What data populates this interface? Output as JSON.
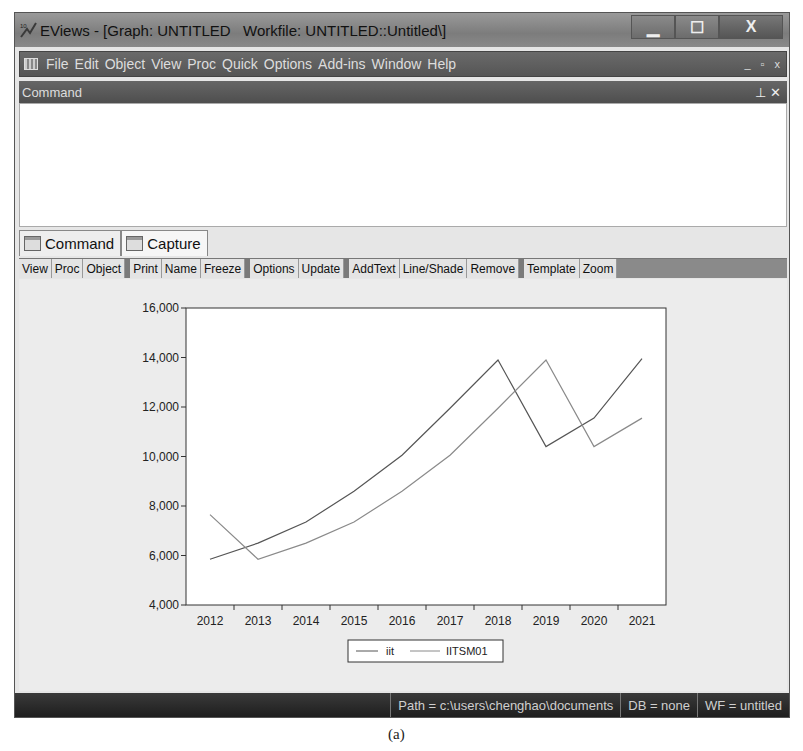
{
  "window": {
    "title": "EViews - [Graph: UNTITLED   Workfile: UNTITLED::Untitled\\]",
    "app_icon": "eviews-logo-icon",
    "controls": [
      "minimize",
      "maximize",
      "close"
    ]
  },
  "menubar": {
    "items": [
      {
        "label": "File"
      },
      {
        "label": "Edit"
      },
      {
        "label": "Object"
      },
      {
        "label": "View"
      },
      {
        "label": "Proc"
      },
      {
        "label": "Quick"
      },
      {
        "label": "Options"
      },
      {
        "label": "Add-ins"
      },
      {
        "label": "Window"
      },
      {
        "label": "Help"
      }
    ],
    "mdi_controls": [
      "_",
      "▫",
      "x"
    ]
  },
  "command_pane": {
    "title": "Command",
    "pin_icon": "pin-icon",
    "close_icon": "close-icon",
    "content": ""
  },
  "tabs": [
    {
      "label": "Command",
      "active": false
    },
    {
      "label": "Capture",
      "active": true
    }
  ],
  "toolbar": {
    "groups": [
      [
        "View",
        "Proc",
        "Object"
      ],
      [
        "Print",
        "Name",
        "Freeze"
      ],
      [
        "Options",
        "Update"
      ],
      [
        "AddText",
        "Line/Shade",
        "Remove"
      ],
      [
        "Template",
        "Zoom"
      ]
    ]
  },
  "chart_data": {
    "type": "line",
    "title": "",
    "xlabel": "",
    "ylabel": "",
    "categories": [
      "2012",
      "2013",
      "2014",
      "2015",
      "2016",
      "2017",
      "2018",
      "2019",
      "2020",
      "2021"
    ],
    "series": [
      {
        "name": "iit",
        "color": "#555555",
        "values": [
          5850,
          6500,
          7350,
          8600,
          10050,
          11950,
          13900,
          10400,
          11550,
          13950
        ]
      },
      {
        "name": "IITSM01",
        "color": "#8a8a8a",
        "values": [
          7650,
          5850,
          6500,
          7350,
          8600,
          10050,
          11950,
          13900,
          10400,
          11550
        ]
      }
    ],
    "ylim": [
      4000,
      16000
    ],
    "yticks": [
      "4,000",
      "6,000",
      "8,000",
      "10,000",
      "12,000",
      "14,000",
      "16,000"
    ],
    "yticks_values": [
      4000,
      6000,
      8000,
      10000,
      12000,
      14000,
      16000
    ],
    "grid": false,
    "legend_position": "bottom-center"
  },
  "statusbar": {
    "path": "Path = c:\\users\\chenghao\\documents",
    "db": "DB = none",
    "wf": "WF = untitled"
  },
  "caption": "(a)"
}
